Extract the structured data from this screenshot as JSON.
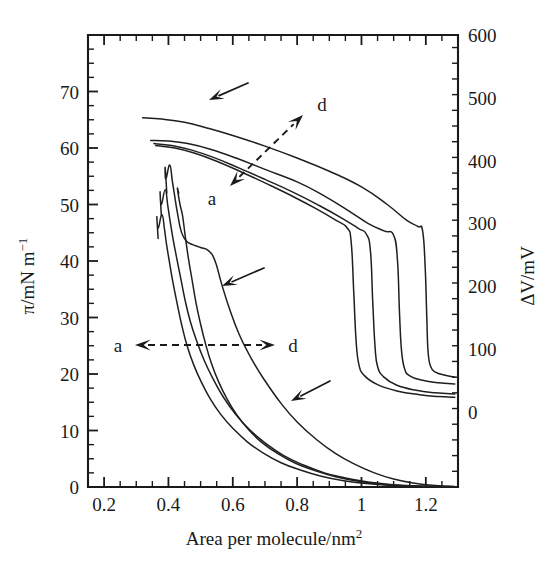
{
  "figure": {
    "name": "surface-pressure-and-surface-potential-isotherms",
    "background_color": "#ffffff",
    "ink_color": "#1a1a1a"
  },
  "chart_data": {
    "type": "line",
    "title": "",
    "subtitle": "",
    "xlabel": "Area per molecule/nm²",
    "xlabel_parts": {
      "base": "Area per molecule/nm",
      "superscript": "2"
    },
    "ylabel_left": "π/mN m⁻¹",
    "ylabel_left_parts": {
      "base": "π/mN m",
      "superscript": "−1"
    },
    "ylabel_right": "ΔV/mV",
    "xlim": [
      0.15,
      1.3
    ],
    "ylim_left": [
      0,
      80
    ],
    "ylim_right": [
      -120,
      600
    ],
    "grid": false,
    "legend": "none",
    "xticks": [
      0.2,
      0.4,
      0.6,
      0.8,
      1.0,
      1.2
    ],
    "xtick_labels": [
      "0.2",
      "0.4",
      "0.6",
      "0.8",
      "1",
      "1.2"
    ],
    "xminor_step": 0.05,
    "yticks_left": [
      0,
      10,
      20,
      30,
      40,
      50,
      60,
      70
    ],
    "ytick_labels_left": [
      "0",
      "10",
      "20",
      "30",
      "40",
      "50",
      "60",
      "70"
    ],
    "yminor_step_left": 2.5,
    "yticks_right": [
      0,
      100,
      200,
      300,
      400,
      500,
      600
    ],
    "ytick_labels_right": [
      "0",
      "100",
      "200",
      "300",
      "400",
      "500",
      "600"
    ],
    "yminor_step_right": 25,
    "series": [
      {
        "name": "surface-potential-cycle-1",
        "axis": "right",
        "quantity": "delta_V",
        "points": [
          [
            0.32,
            468
          ],
          [
            0.38,
            466
          ],
          [
            0.45,
            461
          ],
          [
            0.52,
            452
          ],
          [
            0.6,
            440
          ],
          [
            0.7,
            423
          ],
          [
            0.8,
            404
          ],
          [
            0.9,
            383
          ],
          [
            1.0,
            358
          ],
          [
            1.08,
            330
          ],
          [
            1.14,
            305
          ],
          [
            1.175,
            295
          ],
          [
            1.19,
            288
          ],
          [
            1.198,
            230
          ],
          [
            1.203,
            150
          ],
          [
            1.207,
            95
          ],
          [
            1.215,
            72
          ],
          [
            1.23,
            63
          ],
          [
            1.26,
            58
          ],
          [
            1.29,
            55
          ]
        ]
      },
      {
        "name": "surface-potential-cycle-2",
        "axis": "right",
        "quantity": "delta_V",
        "points": [
          [
            0.345,
            432
          ],
          [
            0.4,
            431
          ],
          [
            0.46,
            427
          ],
          [
            0.53,
            418
          ],
          [
            0.61,
            404
          ],
          [
            0.7,
            386
          ],
          [
            0.8,
            366
          ],
          [
            0.88,
            345
          ],
          [
            0.96,
            320
          ],
          [
            1.02,
            300
          ],
          [
            1.07,
            288
          ],
          [
            1.1,
            281
          ],
          [
            1.112,
            240
          ],
          [
            1.118,
            160
          ],
          [
            1.124,
            100
          ],
          [
            1.133,
            70
          ],
          [
            1.15,
            57
          ],
          [
            1.19,
            50
          ],
          [
            1.24,
            46
          ],
          [
            1.29,
            44
          ]
        ]
      },
      {
        "name": "surface-potential-cycle-3",
        "axis": "right",
        "quantity": "delta_V",
        "points": [
          [
            0.355,
            427
          ],
          [
            0.41,
            424
          ],
          [
            0.47,
            417
          ],
          [
            0.54,
            405
          ],
          [
            0.62,
            388
          ],
          [
            0.7,
            370
          ],
          [
            0.79,
            349
          ],
          [
            0.87,
            328
          ],
          [
            0.94,
            308
          ],
          [
            0.99,
            292
          ],
          [
            1.015,
            283
          ],
          [
            1.028,
            255
          ],
          [
            1.035,
            175
          ],
          [
            1.042,
            105
          ],
          [
            1.05,
            72
          ],
          [
            1.07,
            55
          ],
          [
            1.11,
            42
          ],
          [
            1.17,
            34
          ],
          [
            1.23,
            30
          ],
          [
            1.29,
            28
          ]
        ]
      },
      {
        "name": "surface-potential-cycle-4",
        "axis": "right",
        "quantity": "delta_V",
        "points": [
          [
            0.36,
            424
          ],
          [
            0.42,
            420
          ],
          [
            0.48,
            412
          ],
          [
            0.55,
            399
          ],
          [
            0.63,
            381
          ],
          [
            0.71,
            362
          ],
          [
            0.79,
            342
          ],
          [
            0.86,
            323
          ],
          [
            0.92,
            305
          ],
          [
            0.955,
            293
          ],
          [
            0.968,
            270
          ],
          [
            0.976,
            190
          ],
          [
            0.983,
            115
          ],
          [
            0.992,
            75
          ],
          [
            1.01,
            57
          ],
          [
            1.05,
            43
          ],
          [
            1.11,
            33
          ],
          [
            1.18,
            27
          ],
          [
            1.24,
            24
          ],
          [
            1.29,
            23
          ]
        ]
      },
      {
        "name": "surface-pressure-cycle-1",
        "axis": "left",
        "quantity": "pi",
        "points": [
          [
            0.395,
            52.0
          ],
          [
            0.39,
            56.5
          ],
          [
            0.392,
            54.5
          ],
          [
            0.404,
            57.0
          ],
          [
            0.412,
            54.2
          ],
          [
            0.418,
            52.0
          ],
          [
            0.428,
            48.5
          ],
          [
            0.44,
            45.2
          ],
          [
            0.455,
            43.6
          ],
          [
            0.475,
            42.9
          ],
          [
            0.5,
            42.4
          ],
          [
            0.525,
            41.8
          ],
          [
            0.545,
            40.0
          ],
          [
            0.565,
            36.0
          ],
          [
            0.59,
            31.5
          ],
          [
            0.62,
            27.0
          ],
          [
            0.66,
            22.5
          ],
          [
            0.7,
            18.8
          ],
          [
            0.75,
            14.8
          ],
          [
            0.8,
            11.5
          ],
          [
            0.86,
            8.4
          ],
          [
            0.92,
            5.9
          ],
          [
            0.98,
            4.0
          ],
          [
            1.04,
            2.5
          ],
          [
            1.1,
            1.4
          ],
          [
            1.16,
            0.7
          ],
          [
            1.23,
            0.25
          ],
          [
            1.29,
            0.1
          ]
        ]
      },
      {
        "name": "surface-pressure-cycle-2",
        "axis": "left",
        "quantity": "pi",
        "points": [
          [
            0.378,
            48.0
          ],
          [
            0.374,
            52.2
          ],
          [
            0.378,
            50.0
          ],
          [
            0.39,
            52.6
          ],
          [
            0.398,
            49.8
          ],
          [
            0.404,
            47.5
          ],
          [
            0.414,
            44.0
          ],
          [
            0.424,
            41.0
          ],
          [
            0.438,
            37.0
          ],
          [
            0.452,
            33.0
          ],
          [
            0.468,
            29.3
          ],
          [
            0.488,
            25.8
          ],
          [
            0.512,
            22.3
          ],
          [
            0.54,
            19.0
          ],
          [
            0.572,
            15.8
          ],
          [
            0.61,
            12.8
          ],
          [
            0.655,
            10.0
          ],
          [
            0.705,
            7.6
          ],
          [
            0.76,
            5.5
          ],
          [
            0.82,
            3.9
          ],
          [
            0.885,
            2.5
          ],
          [
            0.95,
            1.6
          ],
          [
            1.02,
            0.9
          ],
          [
            1.09,
            0.45
          ],
          [
            1.16,
            0.2
          ],
          [
            1.23,
            0.1
          ],
          [
            1.29,
            0.05
          ]
        ]
      },
      {
        "name": "surface-pressure-cycle-3",
        "axis": "left",
        "quantity": "pi",
        "points": [
          [
            0.368,
            44.0
          ],
          [
            0.364,
            47.8
          ],
          [
            0.368,
            45.8
          ],
          [
            0.38,
            48.2
          ],
          [
            0.388,
            45.5
          ],
          [
            0.394,
            43.0
          ],
          [
            0.404,
            39.5
          ],
          [
            0.414,
            36.2
          ],
          [
            0.428,
            32.2
          ],
          [
            0.442,
            28.5
          ],
          [
            0.458,
            25.0
          ],
          [
            0.478,
            21.7
          ],
          [
            0.502,
            18.6
          ],
          [
            0.53,
            15.6
          ],
          [
            0.562,
            12.9
          ],
          [
            0.6,
            10.4
          ],
          [
            0.645,
            8.0
          ],
          [
            0.695,
            6.0
          ],
          [
            0.75,
            4.3
          ],
          [
            0.81,
            3.0
          ],
          [
            0.875,
            1.9
          ],
          [
            0.945,
            1.1
          ],
          [
            1.015,
            0.6
          ],
          [
            1.09,
            0.3
          ],
          [
            1.16,
            0.12
          ],
          [
            1.23,
            0.05
          ],
          [
            1.29,
            0.02
          ]
        ]
      },
      {
        "name": "surface-pressure-cycle-4",
        "axis": "left",
        "quantity": "pi",
        "points": [
          [
            0.432,
            52.0
          ],
          [
            0.428,
            52.8
          ],
          [
            0.436,
            50.0
          ],
          [
            0.444,
            48.0
          ],
          [
            0.452,
            44.5
          ],
          [
            0.462,
            40.5
          ],
          [
            0.474,
            36.5
          ],
          [
            0.486,
            32.5
          ],
          [
            0.5,
            28.8
          ],
          [
            0.516,
            25.2
          ],
          [
            0.534,
            21.8
          ],
          [
            0.556,
            18.6
          ],
          [
            0.582,
            15.6
          ],
          [
            0.612,
            12.8
          ],
          [
            0.648,
            10.2
          ],
          [
            0.69,
            7.9
          ],
          [
            0.74,
            5.9
          ],
          [
            0.795,
            4.2
          ],
          [
            0.855,
            2.9
          ],
          [
            0.92,
            1.8
          ],
          [
            0.99,
            1.0
          ],
          [
            1.06,
            0.5
          ],
          [
            1.13,
            0.22
          ],
          [
            1.2,
            0.08
          ],
          [
            1.29,
            0.02
          ]
        ]
      }
    ],
    "annotations": [
      {
        "name": "arrow-upper-potential",
        "kind": "solid-arrow",
        "label": ""
      },
      {
        "name": "arrow-pi-shoulder",
        "kind": "solid-arrow",
        "label": ""
      },
      {
        "name": "arrow-pi-lower",
        "kind": "solid-arrow",
        "label": ""
      },
      {
        "name": "dashed-arrow-potential",
        "kind": "dashed-double-arrow",
        "label_start": "a",
        "label_end": "d"
      },
      {
        "name": "dashed-arrow-pressure",
        "kind": "dashed-double-arrow",
        "label_start": "a",
        "label_end": "d"
      }
    ]
  },
  "labels": {
    "x_axis_base": "Area per molecule/nm",
    "x_axis_sup": "2",
    "y_left_base": "π/mN m",
    "y_left_sup": "−1",
    "y_right": "ΔV/mV",
    "annot_a_upper": "a",
    "annot_d_upper": "d",
    "annot_a_lower": "a",
    "annot_d_lower": "d",
    "xtick_0": "0.2",
    "xtick_1": "0.4",
    "xtick_2": "0.6",
    "xtick_3": "0.8",
    "xtick_4": "1",
    "xtick_5": "1.2",
    "ytick_left_0": "0",
    "ytick_left_1": "10",
    "ytick_left_2": "20",
    "ytick_left_3": "30",
    "ytick_left_4": "40",
    "ytick_left_5": "50",
    "ytick_left_6": "60",
    "ytick_left_7": "70",
    "ytick_right_0": "0",
    "ytick_right_1": "100",
    "ytick_right_2": "200",
    "ytick_right_3": "300",
    "ytick_right_4": "400",
    "ytick_right_5": "500",
    "ytick_right_6": "600"
  }
}
